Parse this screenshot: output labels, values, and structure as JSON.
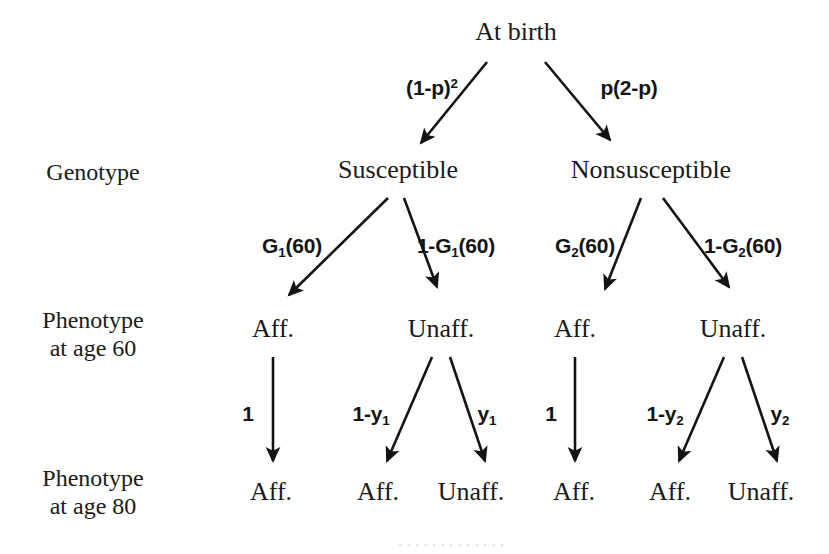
{
  "figure": {
    "type": "probability-tree-diagram",
    "root": {
      "label": "At birth",
      "x": 516,
      "y": 18
    },
    "stage_labels": [
      {
        "name": "genotype",
        "lines": [
          "Genotype"
        ],
        "x": 93,
        "y": 158
      },
      {
        "name": "phenotype-60",
        "lines": [
          "Phenotype",
          "at age 60"
        ],
        "x": 93,
        "y": 306
      },
      {
        "name": "phenotype-80",
        "lines": [
          "Phenotype",
          "at age 80"
        ],
        "x": 93,
        "y": 464
      }
    ],
    "genotype_nodes": [
      {
        "label": "Susceptible",
        "x": 398,
        "y": 156
      },
      {
        "label": "Nonsusceptible",
        "x": 651,
        "y": 156
      }
    ],
    "phenotype60_nodes": [
      {
        "label": "Aff.",
        "x": 273,
        "y": 315
      },
      {
        "label": "Unaff.",
        "x": 441,
        "y": 315
      },
      {
        "label": "Aff.",
        "x": 575,
        "y": 315
      },
      {
        "label": "Unaff.",
        "x": 733,
        "y": 315
      }
    ],
    "phenotype80_nodes": [
      {
        "label": "Aff.",
        "x": 271,
        "y": 478
      },
      {
        "label": "Aff.",
        "x": 378,
        "y": 478
      },
      {
        "label": "Unaff.",
        "x": 471,
        "y": 478
      },
      {
        "label": "Aff.",
        "x": 574,
        "y": 478
      },
      {
        "label": "Aff.",
        "x": 670,
        "y": 478
      },
      {
        "label": "Unaff.",
        "x": 761,
        "y": 478
      }
    ],
    "edge_labels": [
      {
        "name": "birth-to-susceptible",
        "text": "(1-p)",
        "sup": "2",
        "sub": "",
        "x": 432,
        "y": 76
      },
      {
        "name": "birth-to-nonsusceptible",
        "text": "p(2-p)",
        "sup": "",
        "sub": "",
        "x": 629,
        "y": 76
      },
      {
        "name": "susceptible-to-aff",
        "text_pre": "G",
        "sub": "1",
        "text_post": "(60)",
        "x": 292,
        "y": 234
      },
      {
        "name": "susceptible-to-unaff",
        "text_pre": "1-G",
        "sub": "1",
        "text_post": "(60)",
        "x": 456,
        "y": 234
      },
      {
        "name": "nonsusceptible-to-aff",
        "text_pre": "G",
        "sub": "2",
        "text_post": "(60)",
        "x": 585,
        "y": 234
      },
      {
        "name": "nonsusceptible-to-unaff",
        "text_pre": "1-G",
        "sub": "2",
        "text_post": "(60)",
        "x": 743,
        "y": 234
      }
    ],
    "edge_labels_level3": [
      {
        "name": "aff1-stays-aff",
        "text_pre": "1",
        "sub": "",
        "text_post": "",
        "x": 248,
        "y": 402
      },
      {
        "name": "unaff1-to-aff",
        "text_pre": "1-y",
        "sub": "1",
        "text_post": "",
        "x": 371,
        "y": 402
      },
      {
        "name": "unaff1-stays-unaff",
        "text_pre": "y",
        "sub": "1",
        "text_post": "",
        "x": 487,
        "y": 402
      },
      {
        "name": "aff2-stays-aff",
        "text_pre": "1",
        "sub": "",
        "text_post": "",
        "x": 551,
        "y": 402
      },
      {
        "name": "unaff2-to-aff",
        "text_pre": "1-y",
        "sub": "2",
        "text_post": "",
        "x": 665,
        "y": 402
      },
      {
        "name": "unaff2-stays-unaff",
        "text_pre": "y",
        "sub": "2",
        "text_post": "",
        "x": 780,
        "y": 402
      }
    ],
    "arrows": [
      {
        "name": "arrow-birth-susceptible",
        "x1": 487,
        "y1": 62,
        "x2": 419,
        "y2": 146
      },
      {
        "name": "arrow-birth-nonsusceptible",
        "x1": 545,
        "y1": 62,
        "x2": 612,
        "y2": 143
      },
      {
        "name": "arrow-susceptible-aff",
        "x1": 388,
        "y1": 198,
        "x2": 287,
        "y2": 298
      },
      {
        "name": "arrow-susceptible-unaff",
        "x1": 404,
        "y1": 198,
        "x2": 438,
        "y2": 290
      },
      {
        "name": "arrow-nonsusceptible-aff",
        "x1": 641,
        "y1": 198,
        "x2": 603,
        "y2": 292
      },
      {
        "name": "arrow-nonsusceptible-unaff",
        "x1": 663,
        "y1": 198,
        "x2": 730,
        "y2": 290
      },
      {
        "name": "arrow-aff1-aff",
        "x1": 273,
        "y1": 357,
        "x2": 273,
        "y2": 463
      },
      {
        "name": "arrow-unaff1-aff",
        "x1": 432,
        "y1": 357,
        "x2": 386,
        "y2": 463
      },
      {
        "name": "arrow-unaff1-unaff",
        "x1": 450,
        "y1": 357,
        "x2": 486,
        "y2": 463
      },
      {
        "name": "arrow-aff2-aff",
        "x1": 575,
        "y1": 357,
        "x2": 575,
        "y2": 463
      },
      {
        "name": "arrow-unaff2-aff",
        "x1": 724,
        "y1": 357,
        "x2": 678,
        "y2": 463
      },
      {
        "name": "arrow-unaff2-unaff",
        "x1": 742,
        "y1": 357,
        "x2": 778,
        "y2": 463
      }
    ],
    "artifact_text": "cut-off caption remnant"
  }
}
